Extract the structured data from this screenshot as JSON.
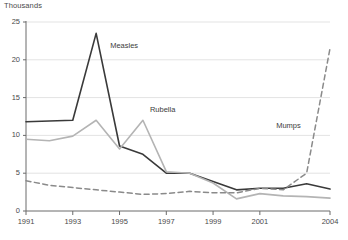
{
  "chart_data": {
    "type": "line",
    "title": "",
    "subtitle": "",
    "ylabel": "Thousands",
    "xlabel": "",
    "ylim": [
      0,
      25
    ],
    "xlim": [
      1991,
      2004
    ],
    "grid": true,
    "legend_position": "inline-annotations",
    "yticks": [
      "0",
      "5",
      "10",
      "15",
      "20",
      "25"
    ],
    "ytick_values": [
      0,
      5,
      10,
      15,
      20,
      25
    ],
    "xticks": [
      "1991",
      "1993",
      "1995",
      "1997",
      "1999",
      "2001",
      "2004"
    ],
    "xtick_values": [
      1991,
      1993,
      1995,
      1997,
      1999,
      2001,
      2004
    ],
    "x": [
      1991,
      1992,
      1993,
      1994,
      1995,
      1996,
      1997,
      1998,
      1999,
      2000,
      2001,
      2002,
      2003,
      2004
    ],
    "series": [
      {
        "name": "Measles",
        "color": "#3a3a3a",
        "style": "solid",
        "values": [
          11.8,
          11.9,
          12.0,
          23.5,
          8.6,
          7.5,
          5.0,
          5.0,
          3.9,
          2.8,
          3.0,
          3.0,
          3.6,
          2.9
        ]
      },
      {
        "name": "Rubella",
        "color": "#b4b4b4",
        "style": "solid",
        "values": [
          9.5,
          9.3,
          9.9,
          12.0,
          8.2,
          12.0,
          5.2,
          5.0,
          3.7,
          1.6,
          2.3,
          2.0,
          1.9,
          1.7
        ]
      },
      {
        "name": "Mumps",
        "color": "#8a8a8a",
        "style": "dashed",
        "values": [
          4.0,
          3.4,
          3.1,
          2.8,
          2.5,
          2.2,
          2.3,
          2.6,
          2.4,
          2.4,
          3.0,
          2.8,
          5.0,
          21.5
        ]
      }
    ],
    "annotations": [
      {
        "text": "Measles",
        "x": 1994.6,
        "y": 21.8
      },
      {
        "text": "Rubella",
        "x": 1996.3,
        "y": 13.4
      },
      {
        "text": "Mumps",
        "x": 2001.7,
        "y": 11.2
      }
    ]
  }
}
